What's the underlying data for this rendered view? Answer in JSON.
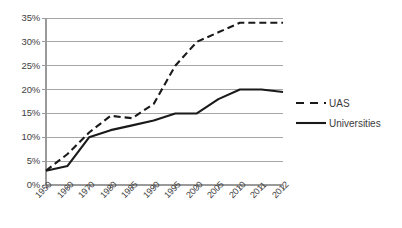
{
  "chart_data": {
    "type": "line",
    "title": "",
    "subtitle": "",
    "xlabel": "",
    "ylabel": "",
    "categories": [
      "1950",
      "1960",
      "1970",
      "1980",
      "1985",
      "1990",
      "1995",
      "2000",
      "2005",
      "2010",
      "2011",
      "2012"
    ],
    "series": [
      {
        "name": "UAS",
        "style": "dashed",
        "color": "#1a1a1a",
        "values": [
          3,
          6.5,
          11,
          14.5,
          14,
          17,
          25,
          30,
          32,
          34,
          34,
          34
        ]
      },
      {
        "name": "Universities",
        "style": "solid",
        "color": "#1a1a1a",
        "values": [
          3,
          4,
          10,
          11.5,
          12.5,
          13.5,
          15,
          15,
          18,
          20,
          20,
          19.5
        ]
      }
    ],
    "ylim": [
      0,
      35
    ],
    "ytick_values": [
      0,
      5,
      10,
      15,
      20,
      25,
      30,
      35
    ],
    "ytick_labels": [
      "0%",
      "5%",
      "10%",
      "15%",
      "20%",
      "25%",
      "30%",
      "35%"
    ],
    "grid": true,
    "grid_color": "#a6a6a6",
    "axis_color": "#9a9a9a",
    "legend_position": "right",
    "legend_entries": [
      {
        "label": "UAS",
        "style": "dashed"
      },
      {
        "label": "Universities",
        "style": "solid"
      }
    ]
  }
}
